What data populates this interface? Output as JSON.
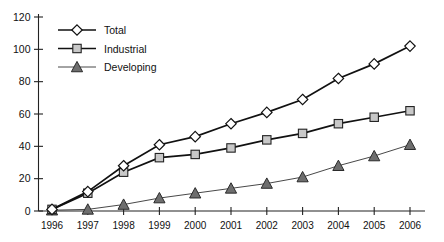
{
  "chart_data": {
    "type": "line",
    "title": "",
    "xlabel": "",
    "ylabel": "",
    "grid": false,
    "legend_position": "top-left-inside",
    "ylim": [
      0,
      120
    ],
    "yticks": [
      0,
      20,
      40,
      60,
      80,
      100,
      120
    ],
    "categories": [
      "1996",
      "1997",
      "1998",
      "1999",
      "2000",
      "2001",
      "2002",
      "2003",
      "2004",
      "2005",
      "2006"
    ],
    "series": [
      {
        "name": "Total",
        "marker": "diamond",
        "marker_fill": "#ffffff",
        "line_color": "#111111",
        "values": [
          1,
          12,
          28,
          41,
          46,
          54,
          61,
          69,
          82,
          91,
          102
        ]
      },
      {
        "name": "Industrial",
        "marker": "square",
        "marker_fill": "#c8c8c8",
        "line_color": "#111111",
        "values": [
          1,
          11,
          24,
          33,
          35,
          39,
          44,
          48,
          54,
          58,
          62
        ]
      },
      {
        "name": "Developing",
        "marker": "triangle",
        "marker_fill": "#6e6e6e",
        "line_color": "#333333",
        "values": [
          0.5,
          1,
          4,
          8,
          11,
          14,
          17,
          21,
          28,
          34,
          41
        ]
      }
    ]
  },
  "axis": {
    "y_tick_labels": [
      "0",
      "20",
      "40",
      "60",
      "80",
      "100",
      "120"
    ],
    "x_tick_labels": [
      "1996",
      "1997",
      "1998",
      "1999",
      "2000",
      "2001",
      "2002",
      "2003",
      "2004",
      "2005",
      "2006"
    ]
  },
  "legend": {
    "items": [
      {
        "label": "Total",
        "marker": "diamond"
      },
      {
        "label": "Industrial",
        "marker": "square"
      },
      {
        "label": "Developing",
        "marker": "triangle"
      }
    ]
  },
  "colors": {
    "axis": "#222222",
    "total_line": "#111111",
    "industrial_line": "#111111",
    "developing_line": "#333333",
    "total_marker": "#ffffff",
    "industrial_marker": "#c8c8c8",
    "developing_marker": "#6e6e6e",
    "background": "#ffffff"
  }
}
